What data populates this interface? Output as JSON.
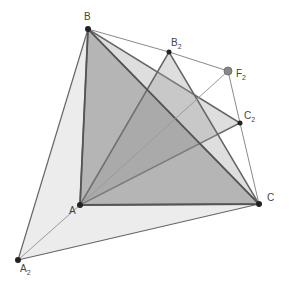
{
  "diagram": {
    "points": {
      "B": {
        "label": "B",
        "sub": "",
        "x": 88,
        "y": 29
      },
      "B2": {
        "label": "B",
        "sub": "2",
        "x": 169,
        "y": 52
      },
      "F2": {
        "label": "F",
        "sub": "2",
        "x": 228,
        "y": 71
      },
      "C2": {
        "label": "C",
        "sub": "2",
        "x": 240,
        "y": 123
      },
      "C": {
        "label": "C",
        "sub": "",
        "x": 259,
        "y": 204
      },
      "A": {
        "label": "A",
        "sub": "",
        "x": 80,
        "y": 205
      },
      "A2": {
        "label": "A",
        "sub": "2",
        "x": 18,
        "y": 260
      }
    },
    "triangles": [
      {
        "name": "A2BC",
        "fill": "#ebebeb"
      },
      {
        "name": "ABC2",
        "fill": "#d9d9d9"
      },
      {
        "name": "AB2C",
        "fill": "#d9d9d9"
      },
      {
        "name": "ABC",
        "fill": "#b8b8b8"
      }
    ],
    "colors": {
      "edge_dark": "#555555",
      "edge_light": "#8a8a8a",
      "point": "#222222",
      "f2_point": "#888888"
    }
  }
}
